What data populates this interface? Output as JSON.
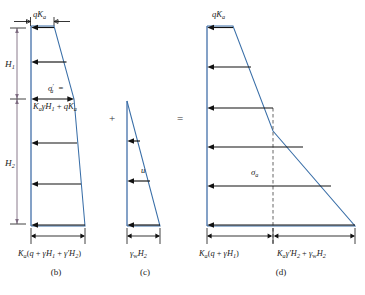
{
  "figure": {
    "colors": {
      "pressure_outline": "#3a6fa8",
      "wall": "#5b82b5",
      "arrow": "#111111",
      "dimension": "#111111",
      "vertical_dimension": "#7d6b80",
      "dashed_line": "#555555",
      "text": "#1a1a1a"
    },
    "operators": {
      "plus": "+",
      "equals": "="
    },
    "vertical_dimensions": [
      {
        "name": "H1",
        "symbol": "H",
        "subscript": "1"
      },
      {
        "name": "H2",
        "symbol": "H",
        "subscript": "2"
      }
    ],
    "panels": [
      {
        "id": "b",
        "caption": "(b)",
        "type": "effective-stress-trapezoid",
        "top_label": {
          "symbol": "qK",
          "subscript": "a"
        },
        "interior_label_line1": {
          "symbol": "σ",
          "prime": "′",
          "subscript": "a",
          "equals": "="
        },
        "interior_label_line2": {
          "parts": [
            "K",
            "a",
            "γ",
            "H",
            "1",
            "+",
            "q",
            "K",
            "a"
          ],
          "text": "KₐγH₁ + qKₐ"
        },
        "bottom_dimension": {
          "text": "Kₐ(q + γH₁ + γ′H₂)"
        },
        "arrow_count": 6
      },
      {
        "id": "c",
        "caption": "(c)",
        "type": "pore-water-pressure-triangle",
        "interior_label": {
          "symbol": "u"
        },
        "bottom_dimension": {
          "text": "γᵥᵥH₂"
        },
        "arrow_count": 3
      },
      {
        "id": "d",
        "caption": "(d)",
        "type": "total-stress-combined",
        "top_label": {
          "symbol": "qK",
          "subscript": "a"
        },
        "interior_label": {
          "symbol": "σ",
          "subscript": "a"
        },
        "bottom_dimension_left": {
          "text": "Kₐ(q + γH₁)"
        },
        "bottom_dimension_right": {
          "text": "Kₐγ′H₂ + γᵥH₂"
        },
        "arrow_count": 6,
        "has_dashed_divider": true
      }
    ]
  }
}
